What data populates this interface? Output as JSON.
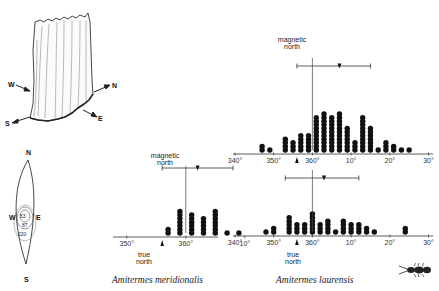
{
  "figure": {
    "mound_drawing": {
      "compass_labels": [
        "W",
        "N",
        "S",
        "E"
      ]
    },
    "compass_diagram": {
      "labels": {
        "n": "N",
        "s": "S",
        "w": "W",
        "e": "E"
      },
      "contour_values": [
        "53",
        "87",
        "220"
      ]
    },
    "species": [
      {
        "name": "Amitermes meridionalis"
      },
      {
        "name": "Amitermes laurensis"
      }
    ],
    "annotations": {
      "magnetic_north": "magnetic north",
      "magnetic_line1": "magnetic",
      "magnetic_line2": "north",
      "true_north_line1": "true",
      "true_north_line2": "north"
    }
  },
  "chart_data": [
    {
      "type": "dot-histogram",
      "title": "Amitermes meridionalis",
      "xlabel": "Mound orientation (degrees)",
      "tick_labels": [
        "350°",
        "360°",
        "10°"
      ],
      "xlim": [
        348,
        12
      ],
      "bin_width_deg": 2,
      "bins_deg": [
        357,
        359,
        1,
        3,
        5,
        7,
        9
      ],
      "counts": [
        2,
        7,
        6,
        5,
        7,
        1,
        1
      ],
      "mean_marker_deg": 2,
      "error_bar_deg": [
        356,
        8
      ],
      "magnetic_north_deg": 0,
      "true_north_deg": 356
    },
    {
      "type": "dot-histogram",
      "title": "Amitermes laurensis (upper)",
      "xlabel": "Mound orientation (degrees)",
      "tick_labels": [
        "340°",
        "350°",
        "360°",
        "10°",
        "20°",
        "30°"
      ],
      "xlim": [
        340,
        30
      ],
      "bin_width_deg": 2,
      "bins_deg": [
        347,
        349,
        353,
        355,
        357,
        359,
        1,
        3,
        5,
        7,
        9,
        11,
        13,
        15,
        17,
        19,
        21,
        23,
        25
      ],
      "counts": [
        2,
        1,
        4,
        3,
        5,
        5,
        10,
        11,
        10,
        11,
        7,
        3,
        10,
        7,
        1,
        3,
        2,
        1,
        1
      ],
      "mean_marker_deg": 7,
      "error_bar_deg": [
        356,
        15
      ],
      "magnetic_north_deg": 0,
      "true_north_deg": 356
    },
    {
      "type": "dot-histogram",
      "title": "Amitermes laurensis (lower)",
      "xlabel": "Mound orientation (degrees)",
      "tick_labels": [
        "340°",
        "350°",
        "360°",
        "10°",
        "20°",
        "30°"
      ],
      "xlim": [
        340,
        30
      ],
      "bin_width_deg": 2,
      "bins_deg": [
        348,
        350,
        354,
        356,
        358,
        360,
        2,
        4,
        6,
        8,
        10,
        12,
        14,
        16,
        24
      ],
      "counts": [
        1,
        2,
        5,
        3,
        3,
        6,
        3,
        4,
        1,
        4,
        3,
        3,
        2,
        1,
        2
      ],
      "mean_marker_deg": 3,
      "error_bar_deg": [
        353,
        12
      ],
      "magnetic_north_deg": 0,
      "true_north_deg": 356
    }
  ]
}
